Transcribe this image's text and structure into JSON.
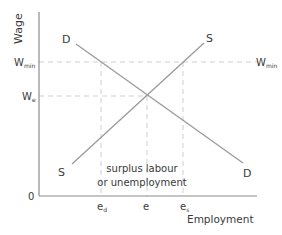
{
  "diagram": {
    "type": "supply-demand-minimum-wage",
    "axes": {
      "y_label": "Wage",
      "x_label": "Employment",
      "origin_label": "0"
    },
    "y_ticks": {
      "wmin": {
        "base": "W",
        "sub": "min"
      },
      "we": {
        "base": "W",
        "sub": "e"
      }
    },
    "right_label": {
      "base": "W",
      "sub": "min"
    },
    "x_ticks": {
      "ed": {
        "base": "e",
        "sub": "d"
      },
      "e": {
        "base": "e",
        "sub": ""
      },
      "es": {
        "base": "e",
        "sub": "s"
      }
    },
    "curves": {
      "demand_top": "D",
      "demand_bottom": "D",
      "supply_top": "S",
      "supply_bottom": "S"
    },
    "annotation": {
      "line1": "surplus labour",
      "line2": "or unemployment"
    },
    "colors": {
      "axis": "#8c8c8c",
      "curve": "#9a9a9a",
      "dashed": "#cfcfcf",
      "text": "#3a3a3a"
    }
  }
}
